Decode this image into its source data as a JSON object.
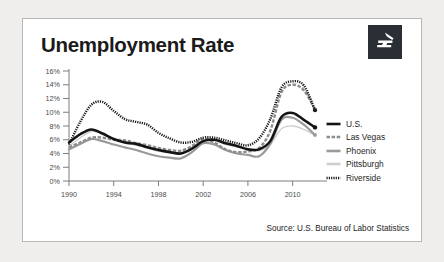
{
  "card": {
    "title": "Unemployment Rate",
    "source": "Source: U.S. Bureau of Labor Statistics",
    "logo_name": "zillow-logo"
  },
  "colors": {
    "us": "#141414",
    "las_vegas": "#8d8d8d",
    "phoenix": "#9a9a9a",
    "pittsburgh": "#cfcfcf",
    "riverside": "#1a1a1a",
    "axis": "#7d7d7d",
    "card_border": "#b9b7b4",
    "page_background": "#efeeec",
    "logo_background": "#2a2f36",
    "title_text": "#1b1b1b"
  },
  "legend": {
    "position": "right",
    "items": [
      {
        "label": "U.S.",
        "key": "us",
        "style": "solid-thick",
        "color": "#141414"
      },
      {
        "label": "Las Vegas",
        "key": "las_vegas",
        "style": "dashed",
        "color": "#8d8d8d"
      },
      {
        "label": "Phoenix",
        "key": "phoenix",
        "style": "solid",
        "color": "#9a9a9a"
      },
      {
        "label": "Pittsburgh",
        "key": "pittsburgh",
        "style": "thin-light",
        "color": "#cfcfcf"
      },
      {
        "label": "Riverside",
        "key": "riverside",
        "style": "zigzag",
        "color": "#1a1a1a"
      }
    ]
  },
  "chart_data": {
    "type": "line",
    "title": "Unemployment Rate",
    "xlabel": "",
    "ylabel": "",
    "xlim": [
      1990,
      2012
    ],
    "ylim": [
      0,
      16
    ],
    "grid": false,
    "ytick_labels": [
      "0%",
      "2%",
      "4%",
      "6%",
      "8%",
      "10%",
      "12%",
      "14%",
      "16%"
    ],
    "ytick_values": [
      0,
      2,
      4,
      6,
      8,
      10,
      12,
      14,
      16
    ],
    "xtick_labels": [
      "1990",
      "1994",
      "1998",
      "2002",
      "2006",
      "2010"
    ],
    "xtick_values": [
      1990,
      1994,
      1998,
      2002,
      2006,
      2010
    ],
    "x": [
      1990,
      1991,
      1992,
      1993,
      1994,
      1995,
      1996,
      1997,
      1998,
      1999,
      2000,
      2001,
      2002,
      2003,
      2004,
      2005,
      2006,
      2007,
      2008,
      2009,
      2010,
      2011,
      2012
    ],
    "series": [
      {
        "name": "U.S.",
        "key": "us",
        "color": "#141414",
        "values": [
          5.6,
          6.8,
          7.5,
          6.9,
          6.1,
          5.6,
          5.4,
          4.9,
          4.5,
          4.2,
          4.0,
          4.7,
          5.8,
          6.0,
          5.5,
          5.1,
          4.6,
          4.6,
          5.8,
          9.3,
          9.9,
          8.9,
          7.8
        ]
      },
      {
        "name": "Las Vegas",
        "key": "las_vegas",
        "color": "#8d8d8d",
        "values": [
          4.9,
          5.6,
          6.3,
          6.3,
          6.0,
          5.9,
          5.5,
          5.2,
          4.8,
          4.5,
          4.4,
          5.1,
          6.1,
          5.6,
          4.6,
          4.2,
          4.3,
          4.8,
          7.3,
          12.9,
          14.0,
          13.2,
          10.4
        ]
      },
      {
        "name": "Phoenix",
        "key": "phoenix",
        "color": "#9a9a9a",
        "values": [
          4.6,
          5.4,
          6.1,
          5.8,
          5.3,
          4.9,
          4.5,
          4.0,
          3.6,
          3.4,
          3.3,
          4.2,
          5.5,
          5.3,
          4.5,
          4.0,
          3.8,
          3.6,
          5.4,
          8.9,
          9.2,
          8.2,
          6.7
        ]
      },
      {
        "name": "Pittsburgh",
        "key": "pittsburgh",
        "color": "#cfcfcf",
        "values": [
          5.0,
          6.3,
          7.2,
          6.9,
          6.1,
          5.5,
          5.2,
          4.8,
          4.3,
          4.2,
          4.1,
          4.8,
          5.9,
          5.9,
          5.3,
          5.0,
          4.7,
          4.4,
          5.3,
          7.6,
          8.0,
          7.5,
          6.6
        ]
      },
      {
        "name": "Riverside",
        "key": "riverside",
        "color": "#1a1a1a",
        "values": [
          5.3,
          8.6,
          11.1,
          11.5,
          10.2,
          9.0,
          8.6,
          8.2,
          7.0,
          6.2,
          5.6,
          5.7,
          6.3,
          6.3,
          5.9,
          5.5,
          5.2,
          6.2,
          9.0,
          13.6,
          14.5,
          13.9,
          10.3
        ]
      }
    ]
  }
}
